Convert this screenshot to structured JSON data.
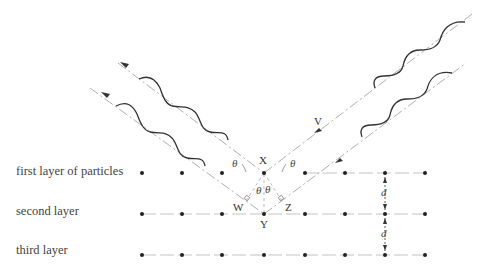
{
  "diagram": {
    "type": "bragg-diffraction",
    "layers": [
      {
        "label": "first layer of particles",
        "y": 173
      },
      {
        "label": "second layer",
        "y": 214
      },
      {
        "label": "third layer",
        "y": 255
      }
    ],
    "particle_x": [
      142,
      182,
      222,
      264,
      305,
      345,
      385,
      425
    ],
    "points": {
      "X": "X",
      "Y": "Y",
      "W": "W",
      "Z": "Z",
      "V": "V"
    },
    "angle_symbol": "θ",
    "spacing_symbol": "d",
    "colors": {
      "wave": "#333333",
      "beam": "#999999",
      "dot": "#222222",
      "layer_line": "#aaaaaa"
    }
  }
}
